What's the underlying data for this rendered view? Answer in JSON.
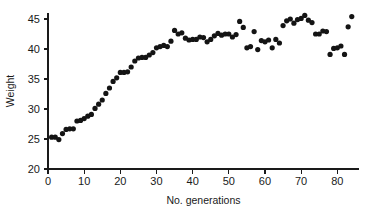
{
  "chart_data": {
    "type": "scatter",
    "title": "",
    "xlabel": "No. generations",
    "ylabel": "Weight",
    "xlim": [
      0,
      86
    ],
    "ylim": [
      20,
      46
    ],
    "xticks": [
      0,
      10,
      20,
      30,
      40,
      50,
      60,
      70,
      80
    ],
    "yticks": [
      20,
      25,
      30,
      35,
      40,
      45
    ],
    "xtick_labels": [
      "0",
      "10",
      "20",
      "30",
      "40",
      "50",
      "60",
      "70",
      "80"
    ],
    "ytick_labels": [
      "20",
      "25",
      "30",
      "35",
      "40",
      "45"
    ],
    "grid": false,
    "legend": null,
    "marker": "circle",
    "marker_color": "#141414",
    "marker_size": 2.6,
    "x": [
      1,
      2,
      3,
      4,
      5,
      6,
      7,
      8,
      9,
      10,
      11,
      12,
      13,
      14,
      15,
      16,
      17,
      18,
      19,
      20,
      21,
      22,
      23,
      24,
      25,
      26,
      27,
      28,
      29,
      30,
      31,
      32,
      33,
      34,
      35,
      36,
      37,
      38,
      39,
      40,
      41,
      42,
      43,
      44,
      45,
      46,
      47,
      48,
      49,
      50,
      51,
      52,
      53,
      54,
      55,
      56,
      57,
      58,
      59,
      60,
      61,
      62,
      63,
      64,
      65,
      66,
      67,
      68,
      69,
      70,
      71,
      72,
      73,
      74,
      75,
      76,
      77,
      78,
      79,
      80,
      81,
      82,
      83,
      84
    ],
    "y": [
      25.3,
      25.3,
      24.9,
      25.9,
      26.6,
      26.7,
      26.7,
      28.0,
      28.1,
      28.4,
      28.8,
      29.1,
      30.1,
      30.8,
      31.5,
      32.6,
      33.5,
      34.6,
      35.2,
      36.1,
      36.1,
      36.2,
      37.0,
      38.0,
      38.5,
      38.6,
      38.6,
      39.0,
      39.4,
      40.2,
      40.4,
      40.6,
      40.4,
      41.3,
      43.1,
      42.5,
      42.7,
      41.8,
      41.5,
      41.6,
      41.6,
      42.0,
      41.9,
      41.2,
      41.6,
      42.2,
      42.6,
      42.3,
      42.5,
      42.5,
      42.0,
      42.4,
      44.6,
      43.6,
      40.2,
      40.4,
      42.9,
      39.9,
      41.4,
      41.2,
      41.5,
      40.2,
      41.6,
      41.0,
      43.9,
      44.7,
      45.0,
      44.3,
      44.9,
      45.1,
      45.6,
      44.8,
      44.4,
      42.5,
      42.5,
      43.0,
      42.9,
      39.1,
      40.1,
      40.2,
      40.5,
      39.1,
      43.7,
      45.4
    ]
  }
}
